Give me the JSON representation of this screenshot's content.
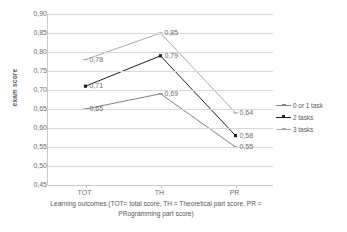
{
  "chart_data": {
    "type": "line",
    "title": "",
    "xlabel": "Learning outcomes (TOT= total score, TH = Theoretical part score, PR = PRogramming part score)",
    "ylabel": "exam score",
    "categories": [
      "TOT",
      "TH",
      "PR"
    ],
    "ylim": [
      0.45,
      0.9
    ],
    "ytick_labels": [
      "0,90",
      "0,85",
      "0,80",
      "0,75",
      "0,70",
      "0,65",
      "0,60",
      "0,55",
      "0,50",
      "0,45"
    ],
    "ytick_values": [
      0.9,
      0.85,
      0.8,
      0.75,
      0.7,
      0.65,
      0.6,
      0.55,
      0.5,
      0.45
    ],
    "grid": true,
    "legend_position": "right",
    "series": [
      {
        "name": "0 or 1 task",
        "values": [
          0.65,
          0.69,
          0.55
        ],
        "labels": [
          "0,65",
          "0,69",
          "0,55"
        ],
        "color": "#808285",
        "marker": "dash"
      },
      {
        "name": "2 tasks",
        "values": [
          0.71,
          0.79,
          0.58
        ],
        "labels": [
          "0,71",
          "0,79",
          "0,58"
        ],
        "color": "#231f20",
        "marker": "square"
      },
      {
        "name": "3 tasks",
        "values": [
          0.78,
          0.85,
          0.64
        ],
        "labels": [
          "0,78",
          "0,85",
          "0,64"
        ],
        "color": "#a7a9ac",
        "marker": "dash"
      }
    ]
  },
  "axis": {
    "y_title": "exam score",
    "x_title_line1": "Learning outcomes (TOT= total score, TH = Theoretical part score, PR =",
    "x_title_line2": "PRogramming part score)"
  },
  "legend": {
    "items": [
      {
        "label": "0 or 1 task"
      },
      {
        "label": "2 tasks"
      },
      {
        "label": "3 tasks"
      }
    ]
  }
}
